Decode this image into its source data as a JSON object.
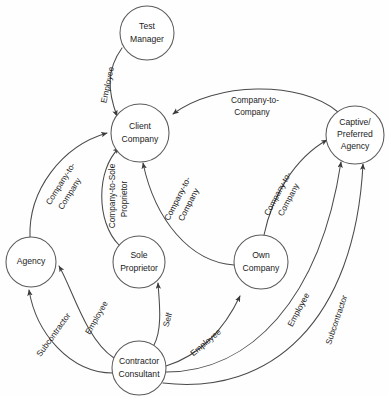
{
  "diagram": {
    "type": "node-link-diagram",
    "background_color": "#fefefe",
    "line_color": "#4a4a4a",
    "text_color": "#1b1b1b",
    "nodes": [
      {
        "id": "test-manager",
        "label_lines": [
          "Test",
          "Manager"
        ],
        "cx": 147,
        "cy": 33,
        "r": 27
      },
      {
        "id": "client-company",
        "label_lines": [
          "Client",
          "Company"
        ],
        "cx": 140,
        "cy": 133,
        "r": 29
      },
      {
        "id": "captive-preferred-agency",
        "label_lines": [
          "Captive/",
          "Preferred",
          "Agency"
        ],
        "cx": 355,
        "cy": 135,
        "r": 29
      },
      {
        "id": "agency",
        "label_lines": [
          "Agency"
        ],
        "cx": 31,
        "cy": 262,
        "r": 25
      },
      {
        "id": "sole-proprietor",
        "label_lines": [
          "Sole",
          "Proprietor"
        ],
        "cx": 139,
        "cy": 262,
        "r": 26
      },
      {
        "id": "own-company",
        "label_lines": [
          "Own",
          "Company"
        ],
        "cx": 261,
        "cy": 262,
        "r": 27
      },
      {
        "id": "contractor-consultant",
        "label_lines": [
          "Contractor",
          "Consultant"
        ],
        "cx": 139,
        "cy": 368,
        "r": 27
      }
    ],
    "edges": [
      {
        "id": "test-manager-to-client-company",
        "from": "test-manager",
        "to": "client-company",
        "label_lines": [
          "Employee"
        ]
      },
      {
        "id": "captive-agency-to-client-company",
        "from": "captive-preferred-agency",
        "to": "client-company",
        "label_lines": [
          "Company-to-",
          "Company"
        ]
      },
      {
        "id": "agency-to-client-company",
        "from": "agency",
        "to": "client-company",
        "label_lines": [
          "Company-to-",
          "Company"
        ]
      },
      {
        "id": "sole-proprietor-to-client-company",
        "from": "sole-proprietor",
        "to": "client-company",
        "label_lines": [
          "Company-to-Sole",
          "Proprietor"
        ]
      },
      {
        "id": "own-company-to-client-company",
        "from": "own-company",
        "to": "client-company",
        "label_lines": [
          "Company-to-",
          "Company"
        ]
      },
      {
        "id": "own-company-to-captive-agency",
        "from": "own-company",
        "to": "captive-preferred-agency",
        "label_lines": [
          "Company-to-",
          "Company"
        ]
      },
      {
        "id": "contractor-to-agency-employee",
        "from": "contractor-consultant",
        "to": "agency",
        "label_lines": [
          "Employee"
        ]
      },
      {
        "id": "contractor-to-agency-subcontractor",
        "from": "contractor-consultant",
        "to": "agency",
        "label_lines": [
          "Subcontractor"
        ]
      },
      {
        "id": "contractor-to-sole-proprietor",
        "from": "contractor-consultant",
        "to": "sole-proprietor",
        "label_lines": [
          "Self"
        ]
      },
      {
        "id": "contractor-to-own-company",
        "from": "contractor-consultant",
        "to": "own-company",
        "label_lines": [
          "Employee"
        ]
      },
      {
        "id": "contractor-to-captive-agency-employee",
        "from": "contractor-consultant",
        "to": "captive-preferred-agency",
        "label_lines": [
          "Employee"
        ]
      },
      {
        "id": "contractor-to-captive-agency-subcontractor",
        "from": "contractor-consultant",
        "to": "captive-preferred-agency",
        "label_lines": [
          "Subcontractor"
        ]
      }
    ],
    "labels": {
      "test_manager_l1": "Test",
      "test_manager_l2": "Manager",
      "client_company_l1": "Client",
      "client_company_l2": "Company",
      "captive_l1": "Captive/",
      "captive_l2": "Preferred",
      "captive_l3": "Agency",
      "agency_l1": "Agency",
      "sole_l1": "Sole",
      "sole_l2": "Proprietor",
      "own_l1": "Own",
      "own_l2": "Company",
      "contractor_l1": "Contractor",
      "contractor_l2": "Consultant",
      "employee_tm": "Employee",
      "cap_to_client_l1": "Company-to-",
      "cap_to_client_l2": "Company",
      "agency_to_client_l1": "Company-to-",
      "agency_to_client_l2": "Company",
      "sole_to_client_l1": "Company-to-Sole",
      "sole_to_client_l2": "Proprietor",
      "own_to_client_l1": "Company-to-",
      "own_to_client_l2": "Company",
      "own_to_cap_l1": "Company-to-",
      "own_to_cap_l2": "Company",
      "employee_agency": "Employee",
      "subcontractor_agency": "Subcontractor",
      "self_sole": "Self",
      "employee_own": "Employee",
      "employee_captive": "Employee",
      "subcontractor_captive": "Subcontractor"
    }
  }
}
